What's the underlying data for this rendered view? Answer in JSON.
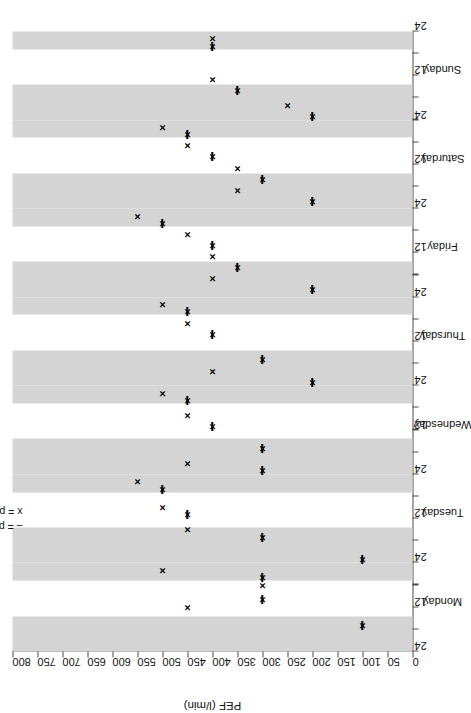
{
  "chart_data": {
    "type": "scatter",
    "title": "",
    "xlabel": "",
    "ylabel": "PEF (l/min)",
    "ylim": [
      0,
      800
    ],
    "ytick_step": 50,
    "yticks": [
      0,
      50,
      100,
      150,
      200,
      250,
      300,
      350,
      400,
      450,
      500,
      550,
      600,
      650,
      700,
      750,
      800
    ],
    "ytick_labels": [
      "0",
      "50",
      "100",
      "150",
      "200",
      "250",
      "300",
      "350",
      "400",
      "450",
      "500",
      "550",
      "600",
      "650",
      "700",
      "750",
      "800"
    ],
    "grid": false,
    "xlim_hours": [
      0,
      168
    ],
    "x_axis_note": "time of day in hours across 7 consecutive days; ticks at 12 and 24 within each day",
    "days": [
      "Monday",
      "Tuesday",
      "Wednesday",
      "Thursday",
      "Friday",
      "Saturday",
      "Sunday"
    ],
    "hour_tick_labels": [
      "12",
      "24"
    ],
    "day_start_label": "24",
    "shaded_bands_note": "alternating grey night/day shading bands",
    "legend_position": "top-left inside plot",
    "series": [
      {
        "name": "pre-bronchodilator",
        "marker": "dash",
        "legend": "– = pre–bronchodilator",
        "points": [
          {
            "day": "Monday",
            "hour": 7,
            "value": 100
          },
          {
            "day": "Monday",
            "hour": 14,
            "value": 300
          },
          {
            "day": "Monday",
            "hour": 20,
            "value": 300
          },
          {
            "day": "Tuesday",
            "hour": 1,
            "value": 100
          },
          {
            "day": "Tuesday",
            "hour": 7,
            "value": 300
          },
          {
            "day": "Tuesday",
            "hour": 13,
            "value": 450
          },
          {
            "day": "Tuesday",
            "hour": 20,
            "value": 500
          },
          {
            "day": "Wednesday",
            "hour": 1,
            "value": 300
          },
          {
            "day": "Wednesday",
            "hour": 7,
            "value": 300
          },
          {
            "day": "Wednesday",
            "hour": 13,
            "value": 400
          },
          {
            "day": "Wednesday",
            "hour": 20,
            "value": 450
          },
          {
            "day": "Thursday",
            "hour": 1,
            "value": 200
          },
          {
            "day": "Thursday",
            "hour": 7,
            "value": 300
          },
          {
            "day": "Thursday",
            "hour": 14,
            "value": 400
          },
          {
            "day": "Thursday",
            "hour": 20,
            "value": 450
          },
          {
            "day": "Friday",
            "hour": 2,
            "value": 200
          },
          {
            "day": "Friday",
            "hour": 8,
            "value": 350
          },
          {
            "day": "Friday",
            "hour": 14,
            "value": 400
          },
          {
            "day": "Friday",
            "hour": 20,
            "value": 500
          },
          {
            "day": "Saturday",
            "hour": 2,
            "value": 200
          },
          {
            "day": "Saturday",
            "hour": 8,
            "value": 300
          },
          {
            "day": "Saturday",
            "hour": 14,
            "value": 400
          },
          {
            "day": "Saturday",
            "hour": 20,
            "value": 450
          },
          {
            "day": "Sunday",
            "hour": 1,
            "value": 200
          },
          {
            "day": "Sunday",
            "hour": 8,
            "value": 350
          },
          {
            "day": "Sunday",
            "hour": 20,
            "value": 400
          }
        ]
      },
      {
        "name": "post-bronchodilator",
        "marker": "x",
        "legend": "x = post–bronchodilator",
        "points": [
          {
            "day": "Monday",
            "hour": 7,
            "value": 100
          },
          {
            "day": "Monday",
            "hour": 12,
            "value": 450
          },
          {
            "day": "Monday",
            "hour": 14,
            "value": 300
          },
          {
            "day": "Monday",
            "hour": 18,
            "value": 300
          },
          {
            "day": "Monday",
            "hour": 20,
            "value": 300
          },
          {
            "day": "Monday",
            "hour": 22,
            "value": 500
          },
          {
            "day": "Tuesday",
            "hour": 1,
            "value": 100
          },
          {
            "day": "Tuesday",
            "hour": 7,
            "value": 300
          },
          {
            "day": "Tuesday",
            "hour": 9,
            "value": 450
          },
          {
            "day": "Tuesday",
            "hour": 13,
            "value": 450
          },
          {
            "day": "Tuesday",
            "hour": 15,
            "value": 500
          },
          {
            "day": "Tuesday",
            "hour": 20,
            "value": 500
          },
          {
            "day": "Tuesday",
            "hour": 22,
            "value": 550
          },
          {
            "day": "Wednesday",
            "hour": 1,
            "value": 300
          },
          {
            "day": "Wednesday",
            "hour": 3,
            "value": 450
          },
          {
            "day": "Wednesday",
            "hour": 7,
            "value": 300
          },
          {
            "day": "Wednesday",
            "hour": 13,
            "value": 400
          },
          {
            "day": "Wednesday",
            "hour": 16,
            "value": 450
          },
          {
            "day": "Wednesday",
            "hour": 20,
            "value": 450
          },
          {
            "day": "Wednesday",
            "hour": 22,
            "value": 500
          },
          {
            "day": "Thursday",
            "hour": 1,
            "value": 200
          },
          {
            "day": "Thursday",
            "hour": 4,
            "value": 400
          },
          {
            "day": "Thursday",
            "hour": 7,
            "value": 300
          },
          {
            "day": "Thursday",
            "hour": 14,
            "value": 400
          },
          {
            "day": "Thursday",
            "hour": 17,
            "value": 450
          },
          {
            "day": "Thursday",
            "hour": 20,
            "value": 450
          },
          {
            "day": "Thursday",
            "hour": 22,
            "value": 500
          },
          {
            "day": "Friday",
            "hour": 2,
            "value": 200
          },
          {
            "day": "Friday",
            "hour": 5,
            "value": 400
          },
          {
            "day": "Friday",
            "hour": 8,
            "value": 350
          },
          {
            "day": "Friday",
            "hour": 11,
            "value": 400
          },
          {
            "day": "Friday",
            "hour": 14,
            "value": 400
          },
          {
            "day": "Friday",
            "hour": 17,
            "value": 450
          },
          {
            "day": "Friday",
            "hour": 20,
            "value": 500
          },
          {
            "day": "Friday",
            "hour": 22,
            "value": 550
          },
          {
            "day": "Saturday",
            "hour": 2,
            "value": 200
          },
          {
            "day": "Saturday",
            "hour": 5,
            "value": 350
          },
          {
            "day": "Saturday",
            "hour": 8,
            "value": 300
          },
          {
            "day": "Saturday",
            "hour": 11,
            "value": 350
          },
          {
            "day": "Saturday",
            "hour": 14,
            "value": 400
          },
          {
            "day": "Saturday",
            "hour": 17,
            "value": 450
          },
          {
            "day": "Saturday",
            "hour": 20,
            "value": 450
          },
          {
            "day": "Saturday",
            "hour": 22,
            "value": 500
          },
          {
            "day": "Sunday",
            "hour": 1,
            "value": 200
          },
          {
            "day": "Sunday",
            "hour": 4,
            "value": 250
          },
          {
            "day": "Sunday",
            "hour": 8,
            "value": 350
          },
          {
            "day": "Sunday",
            "hour": 11,
            "value": 400
          },
          {
            "day": "Sunday",
            "hour": 20,
            "value": 400
          },
          {
            "day": "Sunday",
            "hour": 22,
            "value": 400
          }
        ]
      }
    ]
  },
  "legend": {
    "pre": "– = pre–bronchodilator",
    "post": "x = post–bronchodilator"
  },
  "axes": {
    "y_title": "PEF (l/min)",
    "origin_hour_label": "24"
  }
}
